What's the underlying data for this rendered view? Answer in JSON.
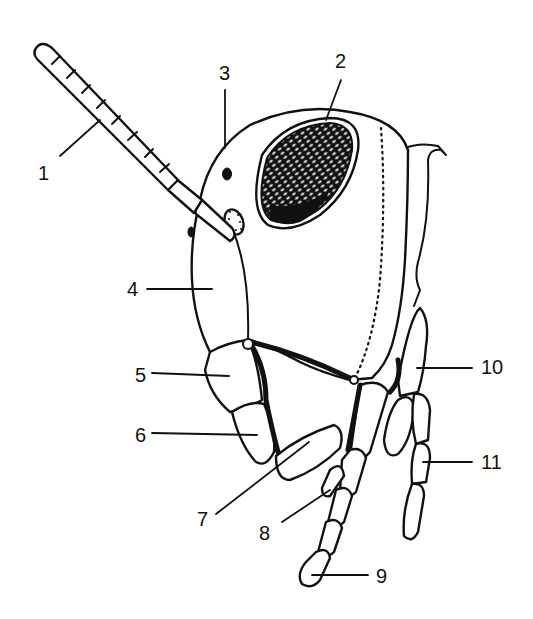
{
  "figure": {
    "colors": {
      "ink": "#111111",
      "background": "#ffffff"
    },
    "labels": [
      {
        "id": "1",
        "text": "1",
        "x": 38,
        "y": 180,
        "line": [
          60,
          156,
          100,
          120
        ]
      },
      {
        "id": "2",
        "text": "2",
        "x": 335,
        "y": 68,
        "line": [
          341,
          80,
          326,
          120
        ]
      },
      {
        "id": "3",
        "text": "3",
        "x": 219,
        "y": 80,
        "line": [
          225,
          90,
          225,
          148
        ]
      },
      {
        "id": "4",
        "text": "4",
        "x": 127,
        "y": 296,
        "line": [
          147,
          289,
          212,
          289
        ]
      },
      {
        "id": "5",
        "text": "5",
        "x": 135,
        "y": 382,
        "line": [
          152,
          373,
          229,
          376
        ]
      },
      {
        "id": "6",
        "text": "6",
        "x": 135,
        "y": 442,
        "line": [
          152,
          433,
          257,
          435
        ]
      },
      {
        "id": "7",
        "text": "7",
        "x": 197,
        "y": 526,
        "line": [
          216,
          514,
          309,
          442
        ]
      },
      {
        "id": "8",
        "text": "8",
        "x": 259,
        "y": 540,
        "line": [
          282,
          522,
          330,
          490
        ]
      },
      {
        "id": "9",
        "text": "9",
        "x": 376,
        "y": 583,
        "line": [
          312,
          575,
          368,
          575
        ]
      },
      {
        "id": "10",
        "text": "10",
        "x": 481,
        "y": 374,
        "line": [
          417,
          368,
          472,
          368
        ]
      },
      {
        "id": "11",
        "text": "11",
        "x": 481,
        "y": 469,
        "line": [
          423,
          462,
          472,
          462
        ]
      }
    ]
  }
}
